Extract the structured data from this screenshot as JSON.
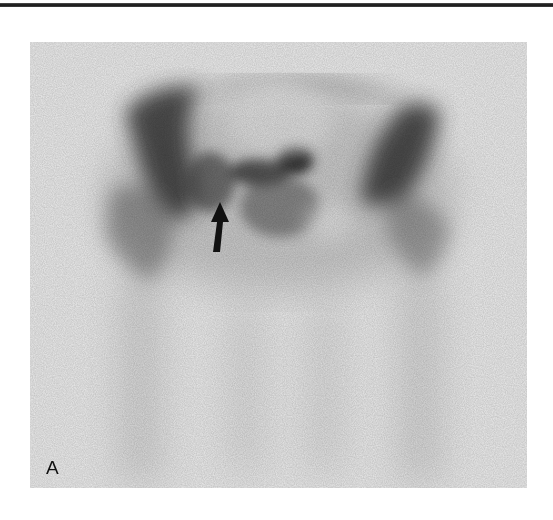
{
  "figure": {
    "panel_label": "A",
    "colors": {
      "background": "#ebebeb",
      "uptake": "#2a2a2a",
      "arrow": "#111111",
      "top_rule": "#111111"
    },
    "annotations": [
      {
        "type": "arrow",
        "direction": "up"
      }
    ]
  }
}
